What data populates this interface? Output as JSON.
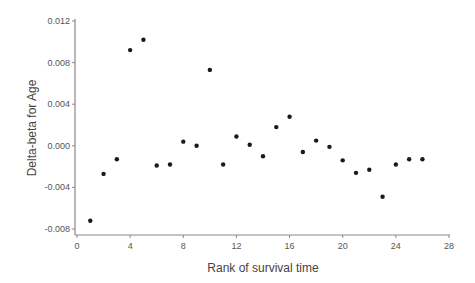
{
  "chart_data": {
    "type": "scatter",
    "title": "",
    "xlabel": "Rank of survival time",
    "ylabel": "Delta-beta for Age",
    "xlim": [
      0,
      28
    ],
    "ylim": [
      -0.008,
      0.012
    ],
    "xticks": [
      0,
      4,
      8,
      12,
      16,
      20,
      24,
      28
    ],
    "yticks": [
      -0.008,
      -0.004,
      0.0,
      0.004,
      0.008,
      0.012
    ],
    "xtick_labels": [
      "0",
      "4",
      "8",
      "12",
      "16",
      "20",
      "24",
      "28"
    ],
    "ytick_labels": [
      "-0.008",
      "-0.004",
      "0.000",
      "0.004",
      "0.008",
      "0.012"
    ],
    "grid": false,
    "legend": null,
    "marker_color": "#1a1a1a",
    "axis_color": "#888888",
    "x": [
      1,
      2,
      3,
      4,
      5,
      6,
      7,
      8,
      9,
      10,
      11,
      12,
      13,
      14,
      15,
      16,
      17,
      18,
      19,
      20,
      21,
      22,
      23,
      24,
      25,
      26
    ],
    "y": [
      -0.0072,
      -0.0027,
      -0.0013,
      0.0092,
      0.0102,
      -0.0019,
      -0.0018,
      0.0004,
      0.0,
      0.0073,
      -0.0018,
      0.0009,
      0.0001,
      -0.001,
      0.0018,
      0.0028,
      -0.0006,
      0.0005,
      -0.0001,
      -0.0014,
      -0.0026,
      -0.0023,
      -0.0049,
      -0.0018,
      -0.0013,
      -0.0013
    ]
  }
}
